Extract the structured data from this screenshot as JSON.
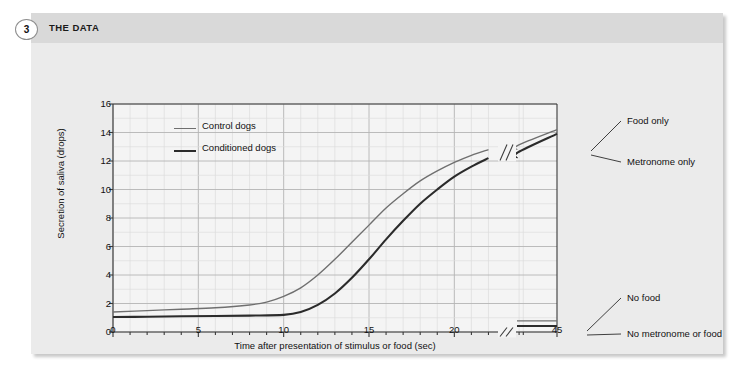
{
  "header": {
    "step_number": "3",
    "title": "THE DATA"
  },
  "chart_data": {
    "type": "line",
    "title": "",
    "xlabel": "Time after presentation of stimulus or food (sec)",
    "ylabel": "Secretion of saliva (drops)",
    "xlim": [
      0,
      45
    ],
    "ylim": [
      0,
      16
    ],
    "xticks": [
      "0",
      "5",
      "10",
      "15",
      "20",
      "45"
    ],
    "xtick_values": [
      0,
      5,
      10,
      15,
      20,
      45
    ],
    "yticks": [
      "0",
      "2",
      "4",
      "6",
      "8",
      "10",
      "12",
      "14",
      "16"
    ],
    "ytick_values": [
      0,
      2,
      4,
      6,
      8,
      10,
      12,
      14,
      16
    ],
    "grid": true,
    "grid_minor_x_step": 1,
    "grid_major_x_step": 5,
    "grid_y_step": 1,
    "axis_break_x": 22.5,
    "legend_position": "top-left-inside",
    "legend": [
      {
        "name": "Control dogs",
        "color": "#6f6f6f",
        "width": 1.4
      },
      {
        "name": "Conditioned dogs",
        "color": "#2b2b2b",
        "width": 2.1
      }
    ],
    "series": [
      {
        "name": "Food only",
        "legend_group": "Control dogs",
        "color": "#6f6f6f",
        "width": 1.4,
        "annotation": "Food only",
        "x": [
          0,
          2,
          4,
          6,
          8,
          9,
          10,
          11,
          12,
          13,
          14,
          15,
          16,
          17,
          18,
          19,
          20,
          21,
          22,
          23,
          45
        ],
        "y": [
          1.4,
          1.5,
          1.6,
          1.7,
          1.9,
          2.1,
          2.5,
          3.1,
          4.0,
          5.1,
          6.3,
          7.5,
          8.7,
          9.7,
          10.6,
          11.3,
          11.9,
          12.4,
          12.8,
          13.1,
          14.2
        ]
      },
      {
        "name": "Metronome only",
        "legend_group": "Conditioned dogs",
        "color": "#2b2b2b",
        "width": 2.1,
        "annotation": "Metronome only",
        "x": [
          0,
          2,
          4,
          6,
          8,
          10,
          11,
          12,
          13,
          14,
          15,
          16,
          17,
          18,
          19,
          20,
          21,
          22,
          23,
          45
        ],
        "y": [
          1.05,
          1.07,
          1.1,
          1.12,
          1.15,
          1.2,
          1.4,
          1.9,
          2.7,
          3.8,
          5.1,
          6.5,
          7.8,
          9.0,
          10.0,
          10.9,
          11.6,
          12.2,
          12.6,
          13.9
        ]
      },
      {
        "name": "No food",
        "legend_group": "Control dogs",
        "color": "#6f6f6f",
        "width": 1.4,
        "annotation": "No food",
        "x": [
          0,
          45
        ],
        "y": [
          0.78,
          0.78
        ]
      },
      {
        "name": "No metronome or food",
        "legend_group": "Conditioned dogs",
        "color": "#2b2b2b",
        "width": 2.1,
        "annotation": "No metronome or food",
        "x": [
          0,
          45
        ],
        "y": [
          0.42,
          0.42
        ]
      }
    ],
    "annotations": [
      {
        "text": "Food only",
        "label_x": 596,
        "label_y": 78,
        "anchor_x": 560,
        "anchor_y": 108
      },
      {
        "text": "Metronome only",
        "label_x": 596,
        "label_y": 119,
        "anchor_x": 560,
        "anchor_y": 112
      },
      {
        "text": "No food",
        "label_x": 596,
        "label_y": 255,
        "anchor_x": 556,
        "anchor_y": 288
      },
      {
        "text": "No metronome or food",
        "label_x": 596,
        "label_y": 291,
        "anchor_x": 556,
        "anchor_y": 292
      }
    ]
  }
}
